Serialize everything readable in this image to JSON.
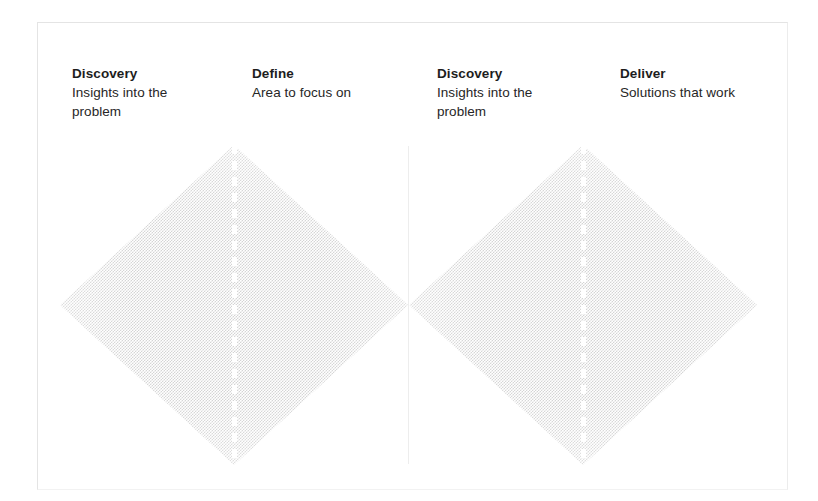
{
  "diagram": {
    "name": "Double Diamond",
    "frame": {
      "visible": true,
      "border_color": "#e4e4e4"
    },
    "columns": [
      {
        "key": "discovery-left",
        "title": "Discovery",
        "subtitle": "Insights into the problem"
      },
      {
        "key": "define",
        "title": "Define",
        "subtitle": "Area to focus on"
      },
      {
        "key": "discovery-right",
        "title": "Discovery",
        "subtitle": "Insights into the problem"
      },
      {
        "key": "deliver",
        "title": "Deliver",
        "subtitle": "Solutions that work"
      }
    ],
    "shapes": [
      {
        "key": "diamond-left",
        "type": "diamond",
        "fill": "#d4d4d4",
        "texture": "halftone-checkerboard",
        "centre_line": "white-dashed"
      },
      {
        "key": "diamond-right",
        "type": "diamond",
        "fill": "#d4d4d4",
        "texture": "halftone-checkerboard",
        "centre_line": "white-dashed"
      }
    ],
    "divider": {
      "color": "#ededed"
    }
  }
}
